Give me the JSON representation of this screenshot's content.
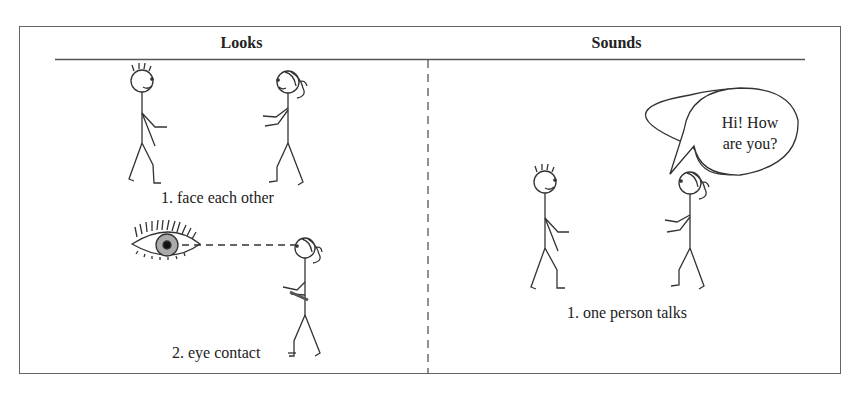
{
  "columns": [
    {
      "title": "Looks",
      "items": [
        {
          "caption": "1. face each other"
        },
        {
          "caption": "2. eye contact"
        }
      ]
    },
    {
      "title": "Sounds",
      "items": [
        {
          "caption": "1. one person talks",
          "speech": [
            "Hi! How",
            "are you?"
          ]
        }
      ]
    }
  ]
}
